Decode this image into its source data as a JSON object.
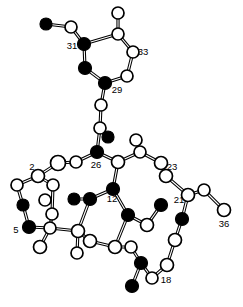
{
  "figure": {
    "width": 243,
    "height": 307,
    "background_color": "#ffffff",
    "bond_color": "#000000",
    "filled_atom_color": "#000000",
    "open_atom_color": "#ffffff"
  },
  "chart_data": {
    "type": "scatter",
    "xlabel": "",
    "ylabel": "",
    "grid": false,
    "legend": "none",
    "xlim": [
      0,
      243
    ],
    "ylim": [
      0,
      307
    ],
    "atom_styles": [
      "filled",
      "open"
    ],
    "atoms": [
      {
        "id": "a1",
        "x": 46,
        "y": 24,
        "r": 6.0,
        "style": "filled",
        "label": ""
      },
      {
        "id": "a2",
        "x": 71,
        "y": 27,
        "r": 6.0,
        "style": "open",
        "label": ""
      },
      {
        "id": "a3",
        "x": 84,
        "y": 44,
        "r": 6.5,
        "style": "filled",
        "label": "31"
      },
      {
        "id": "a4",
        "x": 85,
        "y": 68,
        "r": 6.5,
        "style": "filled",
        "label": ""
      },
      {
        "id": "a5",
        "x": 105,
        "y": 83,
        "r": 6.5,
        "style": "filled",
        "label": "29"
      },
      {
        "id": "a6",
        "x": 127,
        "y": 76,
        "r": 6.0,
        "style": "open",
        "label": ""
      },
      {
        "id": "a7",
        "x": 133,
        "y": 52,
        "r": 6.0,
        "style": "open",
        "label": "33"
      },
      {
        "id": "a8",
        "x": 118,
        "y": 34,
        "r": 6.0,
        "style": "open",
        "label": ""
      },
      {
        "id": "a9",
        "x": 118,
        "y": 13,
        "r": 6.0,
        "style": "open",
        "label": ""
      },
      {
        "id": "a10",
        "x": 101,
        "y": 105,
        "r": 6.0,
        "style": "open",
        "label": ""
      },
      {
        "id": "a11",
        "x": 100,
        "y": 128,
        "r": 6.0,
        "style": "open",
        "label": ""
      },
      {
        "id": "a12",
        "x": 108,
        "y": 137,
        "r": 6.0,
        "style": "filled",
        "label": ""
      },
      {
        "id": "a13",
        "x": 97,
        "y": 152,
        "r": 6.5,
        "style": "filled",
        "label": "26"
      },
      {
        "id": "a14",
        "x": 76,
        "y": 162,
        "r": 6.0,
        "style": "open",
        "label": ""
      },
      {
        "id": "a15",
        "x": 58,
        "y": 163,
        "r": 7.5,
        "style": "open",
        "label": ""
      },
      {
        "id": "a16",
        "x": 38,
        "y": 176,
        "r": 6.5,
        "style": "open",
        "label": "2"
      },
      {
        "id": "a17",
        "x": 17,
        "y": 185,
        "r": 6.0,
        "style": "open",
        "label": ""
      },
      {
        "id": "a18",
        "x": 23,
        "y": 205,
        "r": 6.0,
        "style": "filled",
        "label": ""
      },
      {
        "id": "a19",
        "x": 29,
        "y": 227,
        "r": 6.5,
        "style": "filled",
        "label": "5"
      },
      {
        "id": "a20",
        "x": 45,
        "y": 200,
        "r": 6.0,
        "style": "open",
        "label": ""
      },
      {
        "id": "a21",
        "x": 50,
        "y": 228,
        "r": 6.0,
        "style": "open",
        "label": ""
      },
      {
        "id": "a22",
        "x": 40,
        "y": 247,
        "r": 6.5,
        "style": "open",
        "label": ""
      },
      {
        "id": "a23",
        "x": 118,
        "y": 162,
        "r": 6.5,
        "style": "open",
        "label": ""
      },
      {
        "id": "a24",
        "x": 113,
        "y": 189,
        "r": 6.5,
        "style": "filled",
        "label": "12"
      },
      {
        "id": "a25",
        "x": 140,
        "y": 152,
        "r": 6.0,
        "style": "open",
        "label": ""
      },
      {
        "id": "a26",
        "x": 136,
        "y": 140,
        "r": 6.0,
        "style": "open",
        "label": ""
      },
      {
        "id": "a27",
        "x": 161,
        "y": 163,
        "r": 6.5,
        "style": "open",
        "label": "23"
      },
      {
        "id": "a28",
        "x": 166,
        "y": 176,
        "r": 6.5,
        "style": "open",
        "label": ""
      },
      {
        "id": "a29",
        "x": 188,
        "y": 195,
        "r": 6.5,
        "style": "open",
        "label": "21"
      },
      {
        "id": "a30",
        "x": 204,
        "y": 190,
        "r": 6.0,
        "style": "open",
        "label": ""
      },
      {
        "id": "a31",
        "x": 224,
        "y": 210,
        "r": 6.5,
        "style": "open",
        "label": "36"
      },
      {
        "id": "a32",
        "x": 182,
        "y": 219,
        "r": 6.5,
        "style": "filled",
        "label": ""
      },
      {
        "id": "a33",
        "x": 175,
        "y": 240,
        "r": 6.5,
        "style": "open",
        "label": ""
      },
      {
        "id": "a34",
        "x": 167,
        "y": 265,
        "r": 6.5,
        "style": "open",
        "label": ""
      },
      {
        "id": "a35",
        "x": 141,
        "y": 263,
        "r": 6.5,
        "style": "filled",
        "label": ""
      },
      {
        "id": "a36",
        "x": 132,
        "y": 286,
        "r": 6.5,
        "style": "filled",
        "label": ""
      },
      {
        "id": "a37",
        "x": 152,
        "y": 278,
        "r": 6.0,
        "style": "open",
        "label": "18"
      },
      {
        "id": "a38",
        "x": 131,
        "y": 247,
        "r": 6.0,
        "style": "open",
        "label": ""
      },
      {
        "id": "a39",
        "x": 115,
        "y": 247,
        "r": 6.5,
        "style": "open",
        "label": ""
      },
      {
        "id": "a40",
        "x": 90,
        "y": 241,
        "r": 6.5,
        "style": "open",
        "label": ""
      },
      {
        "id": "a41",
        "x": 78,
        "y": 231,
        "r": 6.5,
        "style": "open",
        "label": ""
      },
      {
        "id": "a42",
        "x": 77,
        "y": 253,
        "r": 6.0,
        "style": "open",
        "label": ""
      },
      {
        "id": "a43",
        "x": 90,
        "y": 199,
        "r": 6.5,
        "style": "filled",
        "label": ""
      },
      {
        "id": "a44",
        "x": 74,
        "y": 199,
        "r": 6.0,
        "style": "filled",
        "label": ""
      },
      {
        "id": "a45",
        "x": 128,
        "y": 215,
        "r": 6.5,
        "style": "filled",
        "label": ""
      },
      {
        "id": "a46",
        "x": 147,
        "y": 225,
        "r": 6.5,
        "style": "open",
        "label": ""
      },
      {
        "id": "a47",
        "x": 161,
        "y": 205,
        "r": 6.5,
        "style": "filled",
        "label": ""
      },
      {
        "id": "a48",
        "x": 53,
        "y": 185,
        "r": 6.0,
        "style": "open",
        "label": ""
      },
      {
        "id": "a49",
        "x": 52,
        "y": 214,
        "r": 6.0,
        "style": "open",
        "label": ""
      }
    ],
    "bonds": [
      {
        "from": "a1",
        "to": "a2"
      },
      {
        "from": "a2",
        "to": "a3"
      },
      {
        "from": "a3",
        "to": "a4"
      },
      {
        "from": "a3",
        "to": "a8"
      },
      {
        "from": "a4",
        "to": "a5"
      },
      {
        "from": "a5",
        "to": "a6"
      },
      {
        "from": "a6",
        "to": "a7"
      },
      {
        "from": "a7",
        "to": "a8"
      },
      {
        "from": "a8",
        "to": "a9"
      },
      {
        "from": "a5",
        "to": "a10"
      },
      {
        "from": "a10",
        "to": "a11"
      },
      {
        "from": "a11",
        "to": "a12"
      },
      {
        "from": "a11",
        "to": "a13"
      },
      {
        "from": "a13",
        "to": "a14"
      },
      {
        "from": "a14",
        "to": "a15"
      },
      {
        "from": "a15",
        "to": "a16"
      },
      {
        "from": "a16",
        "to": "a17"
      },
      {
        "from": "a16",
        "to": "a48"
      },
      {
        "from": "a17",
        "to": "a18"
      },
      {
        "from": "a18",
        "to": "a19"
      },
      {
        "from": "a48",
        "to": "a49"
      },
      {
        "from": "a49",
        "to": "a21"
      },
      {
        "from": "a19",
        "to": "a21"
      },
      {
        "from": "a21",
        "to": "a22"
      },
      {
        "from": "a21",
        "to": "a41"
      },
      {
        "from": "a13",
        "to": "a23"
      },
      {
        "from": "a23",
        "to": "a24"
      },
      {
        "from": "a23",
        "to": "a25"
      },
      {
        "from": "a25",
        "to": "a26"
      },
      {
        "from": "a25",
        "to": "a27"
      },
      {
        "from": "a27",
        "to": "a28"
      },
      {
        "from": "a28",
        "to": "a29"
      },
      {
        "from": "a29",
        "to": "a30"
      },
      {
        "from": "a30",
        "to": "a31"
      },
      {
        "from": "a29",
        "to": "a32"
      },
      {
        "from": "a32",
        "to": "a33"
      },
      {
        "from": "a33",
        "to": "a34"
      },
      {
        "from": "a34",
        "to": "a37"
      },
      {
        "from": "a37",
        "to": "a35"
      },
      {
        "from": "a35",
        "to": "a36"
      },
      {
        "from": "a35",
        "to": "a38"
      },
      {
        "from": "a38",
        "to": "a39"
      },
      {
        "from": "a39",
        "to": "a40"
      },
      {
        "from": "a40",
        "to": "a41"
      },
      {
        "from": "a41",
        "to": "a42"
      },
      {
        "from": "a41",
        "to": "a43"
      },
      {
        "from": "a43",
        "to": "a44"
      },
      {
        "from": "a43",
        "to": "a24"
      },
      {
        "from": "a24",
        "to": "a45"
      },
      {
        "from": "a45",
        "to": "a46"
      },
      {
        "from": "a46",
        "to": "a47"
      },
      {
        "from": "a45",
        "to": "a39"
      }
    ],
    "labels": [
      {
        "text": "31",
        "x": 72,
        "y": 49
      },
      {
        "text": "33",
        "x": 143,
        "y": 55
      },
      {
        "text": "29",
        "x": 117,
        "y": 93
      },
      {
        "text": "26",
        "x": 96,
        "y": 168
      },
      {
        "text": "2",
        "x": 32,
        "y": 170
      },
      {
        "text": "5",
        "x": 16,
        "y": 233
      },
      {
        "text": "12",
        "x": 112,
        "y": 202
      },
      {
        "text": "23",
        "x": 172,
        "y": 170
      },
      {
        "text": "21",
        "x": 179,
        "y": 203
      },
      {
        "text": "36",
        "x": 224,
        "y": 227
      },
      {
        "text": "18",
        "x": 166,
        "y": 283
      }
    ]
  }
}
